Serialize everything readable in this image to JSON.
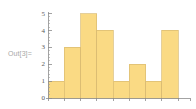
{
  "cell": {
    "out_label": "Out[3]="
  },
  "chart_data": {
    "type": "bar",
    "title": "",
    "subtitle": "",
    "xlabel": "",
    "ylabel": "",
    "categories": [
      "1",
      "2",
      "3",
      "4",
      "5",
      "6",
      "7",
      "8"
    ],
    "values": [
      1,
      3,
      5,
      4,
      1,
      2,
      1,
      4
    ],
    "ylim": [
      0,
      5
    ],
    "xlim": [
      0,
      8
    ],
    "y_ticks": [
      0,
      1,
      2,
      3,
      4,
      5
    ],
    "y_tick_labels": [
      "0",
      "1",
      "2",
      "3",
      "4",
      "5"
    ],
    "y_minor_ticks_per_major": 4,
    "x_tick_labels": [],
    "grid": false,
    "legend": false,
    "legend_position": "none",
    "bar_fill_color": "#fada84",
    "bar_edge_color": "#d9bb72",
    "axis_color": "#8c8c8c",
    "tick_label_color": "#5a5a5a",
    "background_color": "#ffffff",
    "annotations": []
  }
}
